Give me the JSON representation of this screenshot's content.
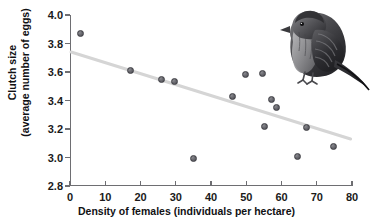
{
  "figure": {
    "top_clipped_text": "",
    "bird_photo_alt": "bird-photo"
  },
  "chart_data": {
    "type": "scatter",
    "title": "",
    "xlabel": "Density of females (individuals per hectare)",
    "ylabel_line1": "Clutch size",
    "ylabel_line2": "(average number of eggs)",
    "xlim": [
      0,
      80
    ],
    "ylim": [
      2.8,
      4.0
    ],
    "xticks": [
      0,
      10,
      20,
      30,
      40,
      50,
      60,
      70,
      80
    ],
    "yticks": [
      "2.8",
      "3.0",
      "3.2",
      "3.4",
      "3.6",
      "3.8",
      "4.0"
    ],
    "xtick_labels": [
      "0",
      "10",
      "20",
      "30",
      "40",
      "50",
      "60",
      "70",
      "80"
    ],
    "grid": false,
    "legend": "none",
    "marker_color": "#5c5c62",
    "trendline_color": "#d5d5d5",
    "axis_color": "#6e6e72",
    "points": [
      {
        "x": 3.1,
        "y": 3.87
      },
      {
        "x": 17.3,
        "y": 3.61
      },
      {
        "x": 25.9,
        "y": 3.55
      },
      {
        "x": 29.6,
        "y": 3.53
      },
      {
        "x": 34.9,
        "y": 2.99
      },
      {
        "x": 46.1,
        "y": 3.43
      },
      {
        "x": 49.8,
        "y": 3.58
      },
      {
        "x": 54.7,
        "y": 3.59
      },
      {
        "x": 55.3,
        "y": 3.22
      },
      {
        "x": 57.2,
        "y": 3.41
      },
      {
        "x": 58.6,
        "y": 3.35
      },
      {
        "x": 64.4,
        "y": 3.01
      },
      {
        "x": 67.0,
        "y": 3.21
      },
      {
        "x": 74.8,
        "y": 3.08
      }
    ],
    "trendline": {
      "x0": 0.3,
      "y0": 3.74,
      "x1": 79.6,
      "y1": 3.13
    }
  }
}
